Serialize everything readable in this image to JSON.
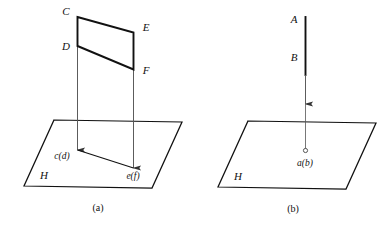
{
  "figure": {
    "background_color": "#ffffff",
    "line_color": "#111111",
    "thin_line_color": "#555555",
    "panels": [
      {
        "id": "a",
        "caption": "(a)",
        "plane_label": "H",
        "labels": {
          "c_top": "C",
          "d_lower": "D",
          "e_top": "E",
          "f_lower": "F",
          "foot_left": "c(d)",
          "foot_right": "e(f)"
        }
      },
      {
        "id": "b",
        "caption": "(b)",
        "plane_label": "H",
        "labels": {
          "a_top": "A",
          "b_lower": "B",
          "foot_point": "a(b)"
        }
      }
    ]
  }
}
